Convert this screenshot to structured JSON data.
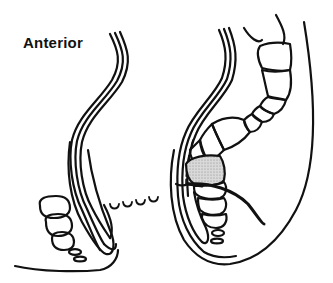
{
  "figure": {
    "type": "anatomical line illustration",
    "label": "Anterior",
    "colors": {
      "line": "#111111",
      "background": "#ffffff",
      "shaded_region": "#c8c8c8"
    }
  }
}
